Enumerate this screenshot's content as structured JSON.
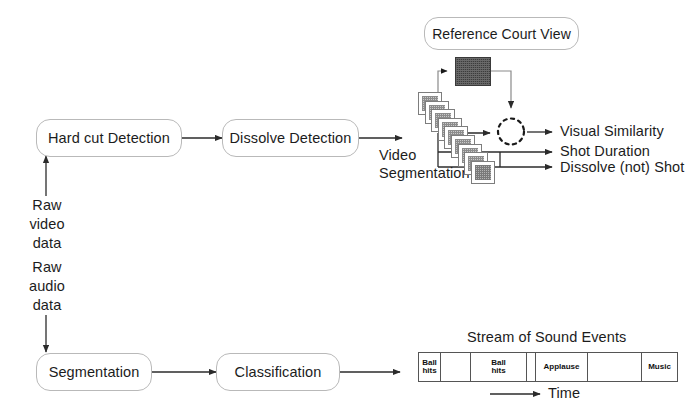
{
  "diagram": {
    "colors": {
      "node_border": "#b9b9b9",
      "arrow": "#2b2b2b",
      "frame_fill": "#c9c9c9",
      "thumb_fill": "#3c3c3c",
      "timeline_border": "#555555"
    }
  },
  "video_pipeline": {
    "nodes": [
      {
        "id": "hard-cut-detection",
        "label": "Hard cut Detection"
      },
      {
        "id": "dissolve-detection",
        "label": "Dissolve Detection"
      },
      {
        "id": "reference-court-view",
        "label": "Reference Court View"
      }
    ],
    "input_label": "Raw\nvideo\ndata",
    "input_lines": [
      "Raw",
      "video",
      "data"
    ],
    "segmentation_lines": [
      "Video",
      "Segmentation"
    ],
    "frame_count": 9,
    "outputs": [
      {
        "id": "visual-similarity",
        "label": "Visual Similarity"
      },
      {
        "id": "shot-duration",
        "label": "Shot Duration"
      },
      {
        "id": "dissolve-not-shot",
        "label": "Dissolve (not) Shot"
      }
    ],
    "comparison_node": "dashed-circle-comparator"
  },
  "audio_pipeline": {
    "input_lines": [
      "Raw",
      "audio",
      "data"
    ],
    "nodes": [
      {
        "id": "segmentation",
        "label": "Segmentation"
      },
      {
        "id": "classification",
        "label": "Classification"
      }
    ],
    "stream_title": "Stream of Sound Events",
    "time_axis_label": "Time",
    "timeline": [
      {
        "label": "Ball\nhits",
        "lines": [
          "Ball",
          "hits"
        ],
        "width": 22
      },
      {
        "label": "",
        "lines": [],
        "width": 30
      },
      {
        "label": "Ball\nhits",
        "lines": [
          "Ball",
          "hits"
        ],
        "width": 56
      },
      {
        "label": "",
        "lines": [],
        "width": 9
      },
      {
        "label": "Applause",
        "lines": [
          "Applause"
        ],
        "width": 52
      },
      {
        "label": "",
        "lines": [],
        "width": 54
      },
      {
        "label": "Music",
        "lines": [
          "Music"
        ],
        "width": 35
      }
    ]
  }
}
